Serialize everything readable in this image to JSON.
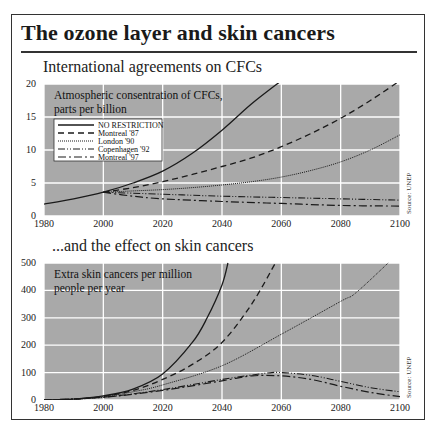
{
  "title": "The ozone layer and skin cancers",
  "panels": [
    {
      "subtitle": "International agreements on CFCs",
      "note_line1": "Atmospheric consentration of CFCs,",
      "note_line2": "parts per billion",
      "source": "Source: UNEP"
    },
    {
      "subtitle": "...and the effect on skin cancers",
      "note_line1": "Extra skin cancers per million",
      "note_line2": "people per year",
      "source": "Source: UNEP"
    }
  ],
  "legend": [
    "NO RESTRICTION",
    "Montreal '87",
    "London '90",
    "Copenhagen '92",
    "Montreal '97"
  ],
  "colors": {
    "plot_bg": "#a9a9a9",
    "grid": "#ffffff",
    "line": "#1a1a1a"
  },
  "chart_data": [
    {
      "type": "line",
      "title": "International agreements on CFCs",
      "ylabel": "Atmospheric consentration of CFCs, parts per billion",
      "xlabel": "",
      "xlim": [
        1980,
        2100
      ],
      "ylim": [
        0,
        20
      ],
      "x_ticks": [
        1980,
        2000,
        2020,
        2040,
        2060,
        2080,
        2100
      ],
      "y_ticks": [
        0,
        5,
        10,
        15,
        20
      ],
      "grid": true,
      "legend_position": "upper-left",
      "series": [
        {
          "name": "NO RESTRICTION",
          "x": [
            1980,
            1990,
            2000,
            2010,
            2020,
            2030,
            2040,
            2050,
            2060
          ],
          "values": [
            1.8,
            2.6,
            3.6,
            5.0,
            6.8,
            9.5,
            13.0,
            17.0,
            20.5
          ]
        },
        {
          "name": "Montreal '87",
          "x": [
            2000,
            2010,
            2020,
            2030,
            2040,
            2050,
            2060,
            2070,
            2080,
            2090,
            2100
          ],
          "values": [
            3.6,
            4.3,
            5.2,
            6.3,
            7.5,
            8.8,
            10.5,
            12.5,
            14.8,
            17.5,
            20.5
          ]
        },
        {
          "name": "London '90",
          "x": [
            2000,
            2010,
            2020,
            2030,
            2040,
            2050,
            2060,
            2070,
            2080,
            2090,
            2100
          ],
          "values": [
            3.6,
            3.8,
            4.0,
            4.3,
            4.7,
            5.2,
            5.9,
            6.9,
            8.2,
            10.0,
            12.3
          ]
        },
        {
          "name": "Copenhagen '92",
          "x": [
            2000,
            2020,
            2040,
            2060,
            2080,
            2100
          ],
          "values": [
            3.6,
            3.3,
            3.0,
            2.8,
            2.6,
            2.4
          ]
        },
        {
          "name": "Montreal '97",
          "x": [
            2000,
            2010,
            2020,
            2040,
            2060,
            2080,
            2100
          ],
          "values": [
            3.6,
            3.0,
            2.6,
            2.2,
            1.9,
            1.6,
            1.5
          ]
        }
      ]
    },
    {
      "type": "line",
      "title": "...and the effect on skin cancers",
      "ylabel": "Extra skin cancers per million people per year",
      "xlabel": "",
      "xlim": [
        1980,
        2100
      ],
      "ylim": [
        0,
        500
      ],
      "x_ticks": [
        1980,
        2000,
        2020,
        2040,
        2060,
        2080,
        2100
      ],
      "y_ticks": [
        0,
        100,
        200,
        300,
        400,
        500
      ],
      "grid": true,
      "series": [
        {
          "name": "NO RESTRICTION",
          "x": [
            1980,
            1990,
            2000,
            2010,
            2020,
            2030,
            2035,
            2040,
            2042
          ],
          "values": [
            0,
            3,
            15,
            40,
            95,
            210,
            300,
            420,
            500
          ]
        },
        {
          "name": "Montreal '87",
          "x": [
            1980,
            1990,
            2000,
            2010,
            2020,
            2030,
            2040,
            2050,
            2058
          ],
          "values": [
            0,
            3,
            13,
            35,
            75,
            130,
            210,
            350,
            500
          ]
        },
        {
          "name": "London '90",
          "x": [
            1980,
            1990,
            2000,
            2010,
            2020,
            2040,
            2060,
            2080,
            2085,
            2096
          ],
          "values": [
            0,
            3,
            12,
            30,
            55,
            125,
            240,
            360,
            390,
            500
          ]
        },
        {
          "name": "Copenhagen '92",
          "x": [
            1980,
            2000,
            2020,
            2040,
            2055,
            2060,
            2070,
            2080,
            2090,
            2100
          ],
          "values": [
            0,
            10,
            38,
            75,
            98,
            100,
            90,
            68,
            45,
            30
          ]
        },
        {
          "name": "Montreal '97",
          "x": [
            1980,
            2000,
            2020,
            2040,
            2050,
            2060,
            2070,
            2080,
            2090,
            2100
          ],
          "values": [
            0,
            10,
            35,
            70,
            88,
            88,
            75,
            50,
            28,
            12
          ]
        }
      ]
    }
  ]
}
